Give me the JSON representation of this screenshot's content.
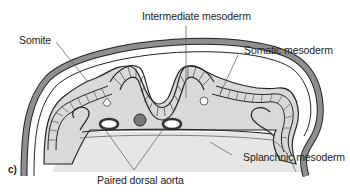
{
  "figure": {
    "panel_label": "c)",
    "labels": {
      "intermediate_mesoderm": "Intermediate mesoderm",
      "somite": "Somite",
      "somatic_mesoderm": "Somatic mesoderm",
      "splanchnic_mesoderm": "Splanchnic mesoderm",
      "paired_dorsal_aorta": "Paired dorsal aorta"
    },
    "colors": {
      "outline": "#222222",
      "ectoderm_band": "#8f8f8f",
      "mesoderm_fill": "#d9d9d9",
      "yolk_fill": "#e6e6e6",
      "notochord": "#7a7a7a",
      "leader_line": "#555555"
    }
  }
}
